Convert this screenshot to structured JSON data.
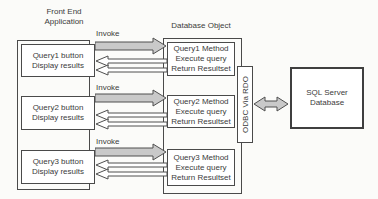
{
  "front_end": {
    "title_line1": "Front End",
    "title_line2": "Application",
    "buttons": [
      {
        "line1": "Query1 button",
        "line2": "Display results"
      },
      {
        "line1": "Query2 button",
        "line2": "Display results"
      },
      {
        "line1": "Query3 button",
        "line2": "Display results"
      }
    ]
  },
  "database_object": {
    "title": "Database Object",
    "methods": [
      {
        "line1": "Query1 Method",
        "line2": "Execute query",
        "line3": "Return Resultset"
      },
      {
        "line1": "Query2 Method",
        "line2": "Execute query",
        "line3": "Return Resultset"
      },
      {
        "line1": "Query3 Method",
        "line2": "Execute query",
        "line3": "Return Resultset"
      }
    ]
  },
  "connector": {
    "label": "ODBC Via RDO"
  },
  "sql_server": {
    "line1": "SQL Server",
    "line2": "Database"
  },
  "labels": {
    "invoke": "Invoke"
  },
  "colors": {
    "arrow_fill": "#c9c9c9",
    "outline": "#4f4f4f",
    "background": "#fbfbf9",
    "text": "#3b3b3b"
  }
}
